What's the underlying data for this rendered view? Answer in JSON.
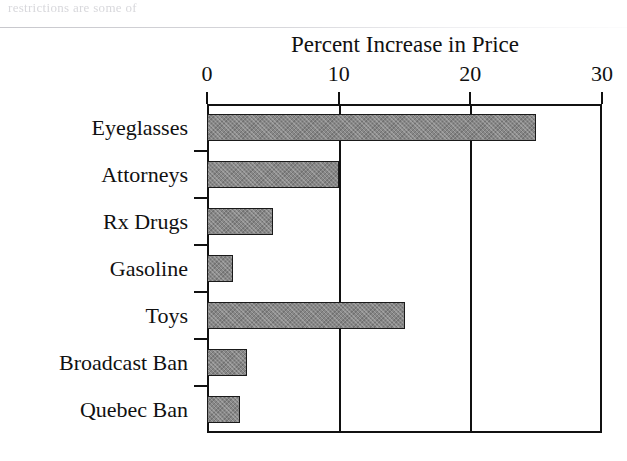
{
  "artifacts": {
    "top_cutoff_text": "restrictions are some of"
  },
  "chart_data": {
    "type": "bar",
    "orientation": "horizontal",
    "title": "Percent Increase in Price",
    "xlabel": "",
    "ylabel": "",
    "xlim": [
      0,
      30
    ],
    "ylim": null,
    "grid": true,
    "legend": null,
    "x_ticks": [
      0,
      10,
      20,
      30
    ],
    "x_tick_labels": [
      "0",
      "10",
      "20",
      "30"
    ],
    "categories": [
      "Eyeglasses",
      "Attorneys",
      "Rx Drugs",
      "Gasoline",
      "Toys",
      "Broadcast Ban",
      "Quebec Ban"
    ],
    "values": [
      25,
      10,
      5,
      2,
      15,
      3,
      2.5
    ],
    "bar_color": "#878787",
    "bar_edge_color": "#1a1a1a",
    "axis_color": "#111111",
    "background_color": "#ffffff"
  }
}
